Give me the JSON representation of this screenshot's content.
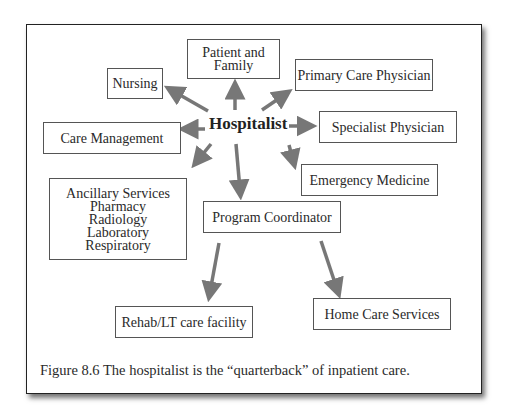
{
  "figure": {
    "center_node": "Hospitalist",
    "nodes": [
      {
        "id": "patient-family",
        "lines": [
          "Patient and",
          "Family"
        ]
      },
      {
        "id": "nursing",
        "lines": [
          "Nursing"
        ]
      },
      {
        "id": "primary-care",
        "lines": [
          "Primary Care Physician"
        ]
      },
      {
        "id": "care-management",
        "lines": [
          "Care Management"
        ]
      },
      {
        "id": "specialist",
        "lines": [
          "Specialist Physician"
        ]
      },
      {
        "id": "emergency",
        "lines": [
          "Emergency Medicine"
        ]
      },
      {
        "id": "ancillary",
        "lines": [
          "Ancillary Services",
          "Pharmacy",
          "Radiology",
          "Laboratory",
          "Respiratory"
        ]
      },
      {
        "id": "program-coordinator",
        "lines": [
          "Program Coordinator"
        ]
      },
      {
        "id": "rehab",
        "lines": [
          "Rehab/LT care facility"
        ]
      },
      {
        "id": "home-care",
        "lines": [
          "Home Care Services"
        ]
      }
    ],
    "edges": [
      [
        "Hospitalist",
        "Patient and Family"
      ],
      [
        "Hospitalist",
        "Nursing"
      ],
      [
        "Hospitalist",
        "Primary Care Physician"
      ],
      [
        "Hospitalist",
        "Care Management"
      ],
      [
        "Hospitalist",
        "Specialist Physician"
      ],
      [
        "Hospitalist",
        "Emergency Medicine"
      ],
      [
        "Hospitalist",
        "Ancillary Services"
      ],
      [
        "Hospitalist",
        "Program Coordinator"
      ],
      [
        "Program Coordinator",
        "Rehab/LT care facility"
      ],
      [
        "Program Coordinator",
        "Home Care Services"
      ]
    ],
    "arrow_color": "#777777",
    "caption": "Figure 8.6 The hospitalist is the “quarterback” of inpatient care."
  }
}
